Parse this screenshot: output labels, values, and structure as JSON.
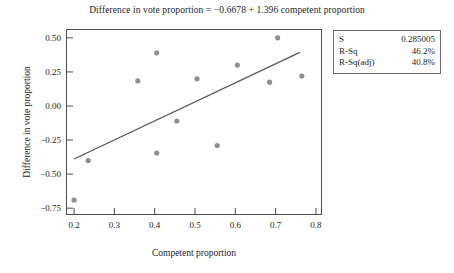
{
  "chart_data": {
    "type": "scatter",
    "title": "Difference in vote proportion =  −0.6678 + 1.396 competent proportion",
    "xlabel": "Competent proportion",
    "ylabel": "Difference in vote proportion",
    "xlim": [
      0.18,
      0.815
    ],
    "ylim": [
      -0.8,
      0.565
    ],
    "grid": false,
    "legend": null,
    "xticks": [
      "0.2",
      "0.3",
      "0.4",
      "0.5",
      "0.6",
      "0.7",
      "0.8"
    ],
    "xtick_values": [
      0.2,
      0.3,
      0.4,
      0.5,
      0.6,
      0.7,
      0.8
    ],
    "yticks": [
      "0.50",
      "0.25",
      "0.00",
      "−0.25",
      "−0.50",
      "−0.75"
    ],
    "ytick_values": [
      0.5,
      0.25,
      0.0,
      -0.25,
      -0.5,
      -0.75
    ],
    "points": [
      {
        "x": 0.2,
        "y": -0.69
      },
      {
        "x": 0.235,
        "y": -0.4
      },
      {
        "x": 0.358,
        "y": 0.185
      },
      {
        "x": 0.405,
        "y": 0.39
      },
      {
        "x": 0.405,
        "y": -0.345
      },
      {
        "x": 0.455,
        "y": -0.11
      },
      {
        "x": 0.505,
        "y": 0.2
      },
      {
        "x": 0.555,
        "y": -0.29
      },
      {
        "x": 0.605,
        "y": 0.3
      },
      {
        "x": 0.685,
        "y": 0.175
      },
      {
        "x": 0.705,
        "y": 0.5
      },
      {
        "x": 0.765,
        "y": 0.22
      }
    ],
    "fit_line": {
      "intercept": -0.6678,
      "slope": 1.396,
      "x_start": 0.2,
      "x_end": 0.76
    },
    "marker_color": "#8f8f8f",
    "line_color": "#555555",
    "frame_color": "#4d4d4d"
  },
  "stats_box": {
    "rows": [
      {
        "key": "S",
        "value": "0.285005"
      },
      {
        "key": "R-Sq",
        "value": "46.2%"
      },
      {
        "key": "R-Sq(adj)",
        "value": "40.8%"
      }
    ]
  }
}
